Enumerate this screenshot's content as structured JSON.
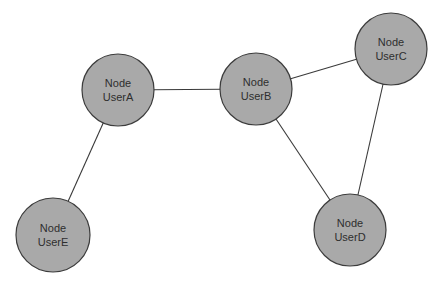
{
  "diagram": {
    "type": "graph",
    "colors": {
      "node_fill": "#a9a9a9",
      "node_stroke": "#3c3c3c",
      "edge": "#3a3a3a",
      "label": "#2e2e2e",
      "background": "#ffffff"
    },
    "nodes": [
      {
        "id": "UserA",
        "line1": "Node",
        "line2": "UserA",
        "cx": 118,
        "cy": 90,
        "r": 36
      },
      {
        "id": "UserB",
        "line1": "Node",
        "line2": "UserB",
        "cx": 256,
        "cy": 89,
        "r": 36
      },
      {
        "id": "UserC",
        "line1": "Node",
        "line2": "UserC",
        "cx": 391,
        "cy": 49,
        "r": 36
      },
      {
        "id": "UserD",
        "line1": "Node",
        "line2": "UserD",
        "cx": 350,
        "cy": 230,
        "r": 36
      },
      {
        "id": "UserE",
        "line1": "Node",
        "line2": "UserE",
        "cx": 53,
        "cy": 235,
        "r": 37
      }
    ],
    "edges": [
      {
        "from": "UserA",
        "to": "UserB"
      },
      {
        "from": "UserA",
        "to": "UserE"
      },
      {
        "from": "UserB",
        "to": "UserC"
      },
      {
        "from": "UserB",
        "to": "UserD"
      },
      {
        "from": "UserC",
        "to": "UserD"
      }
    ]
  }
}
